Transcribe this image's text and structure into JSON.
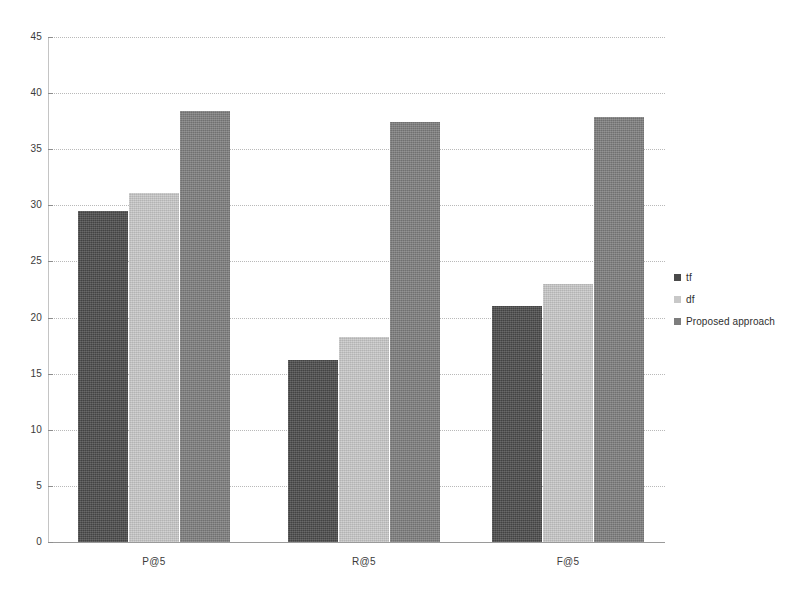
{
  "chart_data": {
    "type": "bar",
    "title": "",
    "xlabel": "",
    "ylabel": "",
    "categories": [
      "P@5",
      "R@5",
      "F@5"
    ],
    "series": [
      {
        "name": "tf",
        "color": "#4a4a4a",
        "values": [
          29.5,
          16.2,
          21.0
        ]
      },
      {
        "name": "df",
        "color": "#c8c8c8",
        "values": [
          31.1,
          18.3,
          23.0
        ]
      },
      {
        "name": "Proposed approach",
        "color": "#7d7d7d",
        "values": [
          38.4,
          37.4,
          37.9
        ]
      }
    ],
    "ylim": [
      0,
      45
    ],
    "ytick_labels": [
      "0",
      "5",
      "10",
      "15",
      "20",
      "25",
      "30",
      "35",
      "40",
      "45"
    ],
    "ytick_values": [
      0,
      5,
      10,
      15,
      20,
      25,
      30,
      35,
      40,
      45
    ],
    "grid": true,
    "grid_style": "dotted-horizontal",
    "legend_position": "right",
    "background": "#ffffff"
  },
  "legend": {
    "entries": [
      {
        "label": "tf",
        "marker": "square-swatch-dark"
      },
      {
        "label": "df",
        "marker": "square-swatch-light"
      },
      {
        "label": "Proposed approach",
        "marker": "square-swatch-medium"
      }
    ]
  }
}
